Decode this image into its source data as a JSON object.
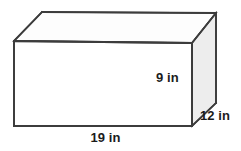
{
  "figure": {
    "name": "rectangular-prism",
    "shape_type": "rectangular prism",
    "unit": "in",
    "colors": {
      "background": "#ffffff",
      "edge_stroke": "#3c3c3c",
      "front_face_fill": "#ffffff",
      "top_face_fill": "#fdfdfd",
      "right_face_fill": "#ededed",
      "label_text": "#1b1b1b"
    },
    "labels": {
      "height": "9 in",
      "depth": "12 in",
      "width": "19 in"
    },
    "dimensions": {
      "height_value": 9,
      "depth_value": 12,
      "width_value": 19,
      "unit": "in"
    },
    "faces": [
      {
        "name": "front-face",
        "fill": "#ffffff"
      },
      {
        "name": "top-face",
        "fill": "#fdfdfd"
      },
      {
        "name": "right-face",
        "fill": "#ededed"
      }
    ]
  }
}
